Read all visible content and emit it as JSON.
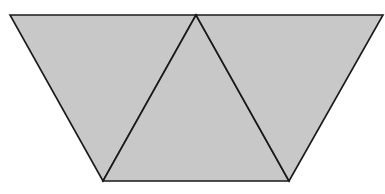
{
  "diagram": {
    "colors": {
      "fill": "#c8c8c8",
      "stroke": "#1a1a1a",
      "background": "#ffffff"
    },
    "vertices": {
      "top_left": [
        10,
        15
      ],
      "top_mid": [
        196,
        15
      ],
      "top_right": [
        383,
        15
      ],
      "bottom_left": [
        103,
        181
      ],
      "bottom_right": [
        289,
        181
      ]
    },
    "triangles": [
      {
        "name": "left-inverted-triangle",
        "points": "10,15 196,15 103,181"
      },
      {
        "name": "middle-upright-triangle",
        "points": "196,15 289,181 103,181"
      },
      {
        "name": "right-inverted-triangle",
        "points": "196,15 383,15 289,181"
      }
    ]
  }
}
